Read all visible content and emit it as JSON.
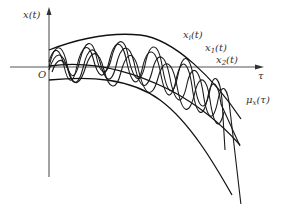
{
  "diagram": {
    "type": "random process sample functions",
    "axes": {
      "y_label": "x(t)",
      "x_label": "τ",
      "origin_label": "O"
    },
    "curves": [
      {
        "label_base": "x",
        "label_sub": "i",
        "label_tail": "(t)",
        "role": "sample function"
      },
      {
        "label_base": "x",
        "label_sub": "1",
        "label_tail": "(t)",
        "role": "sample function"
      },
      {
        "label_base": "x",
        "label_sub": "2",
        "label_tail": "(t)",
        "role": "sample function"
      },
      {
        "label_base": "μ",
        "label_sub": "x",
        "label_tail": "(τ)",
        "role": "mean function"
      }
    ],
    "colors": {
      "line": "#111111",
      "axis": "#555555",
      "background": "#ffffff"
    }
  }
}
